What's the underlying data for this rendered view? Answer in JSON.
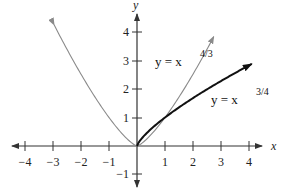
{
  "chart_data": {
    "type": "line",
    "title": "",
    "xlabel": "x",
    "ylabel": "y",
    "xlim": [
      -4.4,
      4.6
    ],
    "ylim": [
      -1.3,
      4.8
    ],
    "grid": false,
    "legend": "inline labels",
    "x_ticks": [
      -4,
      -3,
      -2,
      -1,
      1,
      2,
      3,
      4
    ],
    "x_tick_labels": [
      "−4",
      "−3",
      "−2",
      "−1",
      "1",
      "2",
      "3",
      "4"
    ],
    "y_ticks": [
      -1,
      1,
      2,
      3,
      4
    ],
    "y_tick_labels": [
      "−1",
      "1",
      "2",
      "3",
      "4"
    ],
    "series": [
      {
        "name": "y = x^(4/3)",
        "label_base": "y = x",
        "label_exp": "4/3",
        "color": "#8a8a8a",
        "style": "thin, arrows at both ends",
        "domain": [
          -2.96,
          2.75
        ],
        "x": [
          -2.96,
          -2.5,
          -2,
          -1.5,
          -1,
          -0.5,
          0,
          0.5,
          1,
          1.5,
          2,
          2.5,
          2.75
        ],
        "y": [
          4.25,
          3.39,
          2.52,
          1.72,
          1,
          0.4,
          0,
          0.4,
          1,
          1.72,
          2.52,
          3.39,
          3.86
        ]
      },
      {
        "name": "y = x^(3/4)",
        "label_base": "y = x",
        "label_exp": "3/4",
        "color": "#111111",
        "style": "thick, arrow at right end",
        "domain": [
          0,
          4.1
        ],
        "x": [
          0,
          0.5,
          1,
          1.5,
          2,
          2.5,
          3,
          3.5,
          4,
          4.1
        ],
        "y": [
          0,
          0.59,
          1,
          1.36,
          1.68,
          1.99,
          2.28,
          2.56,
          2.83,
          2.88
        ]
      }
    ],
    "annotations": [
      {
        "text": "y = x^(4/3)",
        "near": [
          0.9,
          3.0
        ]
      },
      {
        "text": "y = x^(3/4)",
        "near": [
          2.6,
          1.3
        ]
      }
    ]
  },
  "axes": {
    "x_name": "x",
    "y_name": "y"
  },
  "labels": {
    "curve1_base": "y = x",
    "curve1_exp": "4/3",
    "curve2_base": "y = x",
    "curve2_exp": "3/4"
  },
  "ticks": {
    "x": [
      "−4",
      "−3",
      "−2",
      "−1",
      "1",
      "2",
      "3",
      "4"
    ],
    "y": [
      "4",
      "3",
      "2",
      "1",
      "−1"
    ]
  }
}
